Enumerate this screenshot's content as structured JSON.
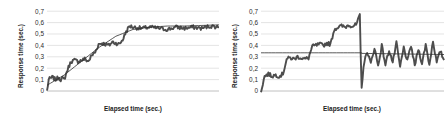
{
  "figure": {
    "background": "#ffffff",
    "panel_count": 2
  },
  "chart_data": [
    {
      "type": "line",
      "panel": "left",
      "title": "",
      "xlabel": "Elapsed time (sec.)",
      "ylabel": "Response time (sec.)",
      "ylim": [
        0,
        0.7
      ],
      "xlim": [
        0,
        100
      ],
      "yticks": [
        0,
        0.1,
        0.2,
        0.3,
        0.4,
        0.5,
        0.6,
        0.7
      ],
      "ytick_labels": [
        "0",
        "0,1",
        "0,2",
        "0,3",
        "0,4",
        "0,5",
        "0,6",
        "0,7"
      ],
      "xtick_labels": [],
      "grid": "horizontal",
      "grid_color": "#d9d9d9",
      "legend": "none",
      "series": [
        {
          "name": "measured response time",
          "style": "noisy-staircase",
          "color": "#4d4d4d",
          "description": "Rises in discrete steps from 0 to a plateau near 0,55 then stays noisy and flat",
          "x": [
            0,
            1,
            2,
            3,
            4,
            5,
            6,
            7,
            8,
            9,
            10,
            12,
            14,
            16,
            18,
            20,
            22,
            24,
            26,
            28,
            30,
            32,
            34,
            36,
            38,
            40,
            42,
            44,
            46,
            48,
            50,
            55,
            60,
            65,
            70,
            75,
            80,
            85,
            90,
            95,
            100
          ],
          "y": [
            0.0,
            0.1,
            0.11,
            0.12,
            0.11,
            0.1,
            0.11,
            0.12,
            0.1,
            0.11,
            0.1,
            0.19,
            0.26,
            0.27,
            0.26,
            0.27,
            0.28,
            0.26,
            0.31,
            0.34,
            0.41,
            0.42,
            0.41,
            0.4,
            0.43,
            0.42,
            0.41,
            0.45,
            0.52,
            0.57,
            0.56,
            0.55,
            0.56,
            0.55,
            0.54,
            0.56,
            0.55,
            0.56,
            0.55,
            0.57,
            0.56
          ]
        },
        {
          "name": "trend line",
          "style": "smooth",
          "color": "#333333",
          "description": "Smooth saturating curve rising from 0,05 to about 0,57",
          "x": [
            0,
            10,
            20,
            30,
            40,
            50,
            60,
            70,
            80,
            90,
            100
          ],
          "y": [
            0.05,
            0.14,
            0.26,
            0.38,
            0.48,
            0.54,
            0.56,
            0.57,
            0.57,
            0.575,
            0.58
          ]
        }
      ]
    },
    {
      "type": "line",
      "panel": "right",
      "title": "",
      "xlabel": "Elapsed time (sec.)",
      "ylabel": "Response time (sec.)",
      "ylim": [
        0,
        0.7
      ],
      "xlim": [
        0,
        100
      ],
      "yticks": [
        0,
        0.1,
        0.2,
        0.3,
        0.4,
        0.5,
        0.6,
        0.7
      ],
      "ytick_labels": [
        "0",
        "0,1",
        "0,2",
        "0,3",
        "0,4",
        "0,5",
        "0,6",
        "0,7"
      ],
      "xtick_labels": [],
      "grid": "horizontal",
      "grid_color": "#d9d9d9",
      "legend": "none",
      "series": [
        {
          "name": "measured response time",
          "style": "noisy-staircase-with-drop",
          "color": "#4d4d4d",
          "description": "Steps up to a plateau near 0,57, spikes to 0,66, drops sharply to near 0, then oscillates widely around 0,30",
          "x": [
            0,
            2,
            4,
            6,
            8,
            10,
            12,
            14,
            16,
            18,
            20,
            22,
            24,
            26,
            28,
            30,
            32,
            34,
            36,
            38,
            40,
            42,
            44,
            46,
            48,
            50,
            52,
            53,
            54,
            54.5,
            55,
            56,
            58,
            60,
            62,
            64,
            66,
            68,
            70,
            72,
            74,
            76,
            78,
            80,
            82,
            84,
            86,
            88,
            90,
            92,
            94,
            96,
            98,
            100
          ],
          "y": [
            0.0,
            0.13,
            0.15,
            0.13,
            0.14,
            0.13,
            0.15,
            0.28,
            0.29,
            0.28,
            0.3,
            0.29,
            0.28,
            0.29,
            0.39,
            0.4,
            0.41,
            0.4,
            0.42,
            0.41,
            0.54,
            0.56,
            0.57,
            0.56,
            0.58,
            0.57,
            0.58,
            0.62,
            0.66,
            0.3,
            0.02,
            0.22,
            0.35,
            0.24,
            0.38,
            0.22,
            0.4,
            0.23,
            0.36,
            0.25,
            0.42,
            0.21,
            0.38,
            0.26,
            0.4,
            0.22,
            0.37,
            0.24,
            0.41,
            0.23,
            0.44,
            0.25,
            0.35,
            0.27
          ]
        },
        {
          "name": "trend line",
          "style": "piecewise",
          "color": "#333333",
          "description": "Flat reference line near 0,335 spanning the full width",
          "x": [
            0,
            55,
            55,
            100
          ],
          "y": [
            0.335,
            0.335,
            0.33,
            0.32
          ]
        }
      ]
    }
  ]
}
